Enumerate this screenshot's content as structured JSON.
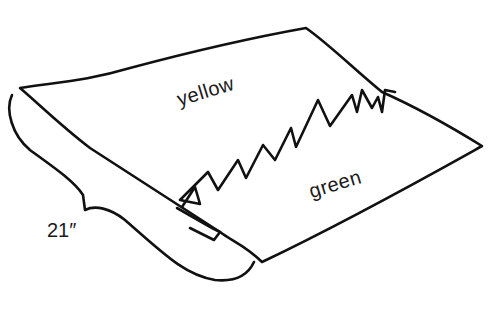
{
  "diagram": {
    "labels": {
      "top_panel": "yellow",
      "bottom_panel": "green",
      "dimension": "21″"
    },
    "colors": {
      "line": "#111111",
      "background": "#ffffff",
      "text": "#1a1a1a"
    }
  }
}
